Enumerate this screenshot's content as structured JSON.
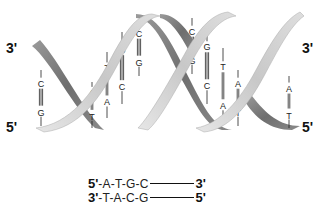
{
  "diagram": {
    "type": "DNA double helix",
    "colors": {
      "strand_light": "#d2d2d2",
      "strand_dark": "#7a7a7a",
      "bond_line": "#222222"
    },
    "left_labels": {
      "top": "3'",
      "bottom": "5'"
    },
    "right_labels": {
      "top": "3'",
      "bottom": "5'"
    },
    "base_pairs": [
      {
        "top": "C",
        "bottom": "G",
        "bonds": 3
      },
      {
        "top": "A",
        "bottom": "T",
        "bonds": 2
      },
      {
        "top": "T",
        "bottom": "A",
        "bonds": 2
      },
      {
        "top": "G",
        "bottom": "C",
        "bonds": 3
      },
      {
        "top": "C",
        "bottom": "G",
        "bonds": 3
      },
      {
        "top": "C",
        "bottom": "G",
        "bonds": 3
      },
      {
        "top": "G",
        "bottom": "C",
        "bonds": 3
      },
      {
        "top": "T",
        "bottom": "A",
        "bonds": 2
      },
      {
        "top": "A",
        "bottom": "T",
        "bonds": 2
      },
      {
        "top": "A",
        "bottom": "T",
        "bonds": 2
      }
    ],
    "sequence": {
      "strand1": {
        "start": "5'",
        "bases": "-A-T-G-C",
        "end": "3'"
      },
      "strand2": {
        "start": "3'",
        "bases": "-T-A-C-G",
        "end": "5'"
      }
    }
  }
}
